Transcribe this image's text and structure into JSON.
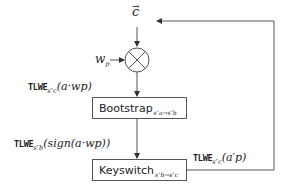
{
  "diagram": {
    "type": "flow",
    "inputs": {
      "vector_c": "c",
      "weight": {
        "base": "w",
        "sub": "p"
      }
    },
    "operator": {
      "symbol": "⊗",
      "meaning": "multiply"
    },
    "nodes": [
      {
        "id": "bootstrap",
        "label": "Bootstrap",
        "subscript": "s″a→s″b"
      },
      {
        "id": "keyswitch",
        "label": "Keyswitch",
        "subscript": "s″b→s″c"
      }
    ],
    "edge_labels": {
      "mult_to_bootstrap": {
        "prefix": "TLWE",
        "key": "s″c",
        "arg": "(a·wp)"
      },
      "bootstrap_to_keyswitch": {
        "prefix": "TLWE",
        "key": "s″b",
        "arg": "(sign(a·wp))"
      },
      "feedback": {
        "prefix": "TLWE",
        "key": "s″c",
        "arg": "(a′p)"
      }
    },
    "colors": {
      "line": "#555555",
      "text": "#222222",
      "background": "#ffffff"
    }
  }
}
